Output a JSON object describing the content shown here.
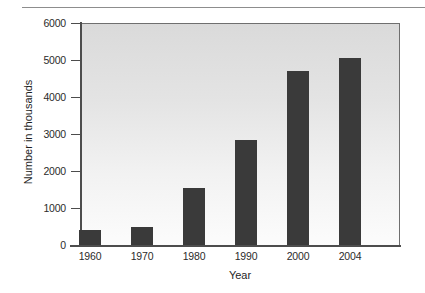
{
  "chart_data": {
    "type": "bar",
    "title": "",
    "xlabel": "Year",
    "ylabel": "Number in thousands",
    "categories": [
      "1960",
      "1970",
      "1980",
      "1990",
      "2000",
      "2004"
    ],
    "values": [
      400,
      480,
      1550,
      2830,
      4700,
      5060
    ],
    "ylim": [
      0,
      6000
    ],
    "yticks": [
      0,
      1000,
      2000,
      3000,
      4000,
      5000,
      6000
    ],
    "ytick_labels": [
      "0",
      "1000",
      "2000",
      "3000",
      "4000",
      "5000",
      "6000"
    ],
    "grid": false,
    "legend": null,
    "bar_color": "#3a3a3a",
    "plot_background_top": "#dadada",
    "plot_background_bottom": "#fcfcfc",
    "axis_color": "#4d4d4d"
  }
}
